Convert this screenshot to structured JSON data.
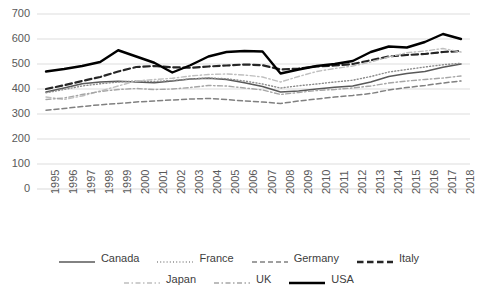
{
  "chart_data": {
    "type": "line",
    "title": "",
    "xlabel": "",
    "ylabel": "",
    "grid": true,
    "legend_position": "bottom",
    "ylim": [
      0,
      700
    ],
    "yticks": [
      0,
      100,
      200,
      300,
      400,
      500,
      600,
      700
    ],
    "categories": [
      "1995",
      "1996",
      "1997",
      "1998",
      "1999",
      "2000",
      "2001",
      "2002",
      "2003",
      "2004",
      "2005",
      "2006",
      "2007",
      "2008",
      "2009",
      "2010",
      "2011",
      "2012",
      "2013",
      "2014",
      "2015",
      "2016",
      "2017",
      "2018"
    ],
    "series": [
      {
        "name": "Canada",
        "style": "solid",
        "color": "#595959",
        "width": 1.6,
        "values": [
          388,
          404,
          421,
          428,
          431,
          428,
          425,
          432,
          440,
          443,
          438,
          425,
          410,
          388,
          392,
          400,
          407,
          412,
          428,
          450,
          462,
          470,
          487,
          500
        ]
      },
      {
        "name": "France",
        "style": "dotted",
        "color": "#8c8c8c",
        "width": 1.4,
        "values": [
          385,
          398,
          412,
          421,
          428,
          432,
          430,
          434,
          440,
          444,
          441,
          432,
          420,
          404,
          413,
          420,
          428,
          435,
          450,
          468,
          478,
          488,
          497,
          503
        ]
      },
      {
        "name": "Germany",
        "style": "dashed",
        "color": "#808080",
        "width": 1.5,
        "values": [
          315,
          322,
          330,
          337,
          342,
          348,
          352,
          356,
          360,
          362,
          358,
          352,
          348,
          342,
          352,
          360,
          368,
          374,
          382,
          396,
          406,
          414,
          424,
          432
        ]
      },
      {
        "name": "Italy",
        "style": "bold-dash",
        "color": "#262626",
        "width": 2.2,
        "values": [
          400,
          415,
          432,
          448,
          470,
          488,
          492,
          487,
          485,
          490,
          494,
          498,
          495,
          478,
          482,
          490,
          494,
          500,
          515,
          530,
          536,
          540,
          548,
          552
        ]
      },
      {
        "name": "Japan",
        "style": "light-dashdot",
        "color": "#bfbfbf",
        "width": 1.4,
        "values": [
          368,
          358,
          372,
          392,
          412,
          432,
          438,
          443,
          452,
          458,
          460,
          456,
          448,
          428,
          450,
          470,
          482,
          492,
          508,
          528,
          545,
          552,
          562,
          548
        ]
      },
      {
        "name": "UK",
        "style": "dashdot",
        "color": "#a6a6a6",
        "width": 1.4,
        "values": [
          358,
          364,
          378,
          390,
          398,
          402,
          398,
          400,
          406,
          414,
          412,
          404,
          396,
          378,
          386,
          394,
          398,
          404,
          412,
          424,
          432,
          438,
          444,
          452
        ]
      },
      {
        "name": "USA",
        "style": "solid-bold",
        "color": "#000000",
        "width": 2.4,
        "values": [
          470,
          480,
          492,
          508,
          555,
          530,
          505,
          466,
          495,
          530,
          548,
          552,
          550,
          462,
          478,
          492,
          500,
          512,
          548,
          570,
          566,
          588,
          620,
          600
        ]
      }
    ]
  },
  "axes": {
    "y_tick_labels": [
      "700",
      "600",
      "500",
      "400",
      "300",
      "200",
      "100",
      "0"
    ],
    "x_tick_labels": [
      "1995",
      "1996",
      "1997",
      "1998",
      "1999",
      "2000",
      "2001",
      "2002",
      "2003",
      "2004",
      "2005",
      "2006",
      "2007",
      "2008",
      "2009",
      "2010",
      "2011",
      "2012",
      "2013",
      "2014",
      "2015",
      "2016",
      "2017",
      "2018"
    ]
  },
  "legend": {
    "row1": [
      {
        "name": "Canada",
        "style": "solid",
        "color": "#595959"
      },
      {
        "name": "France",
        "style": "dotted",
        "color": "#8c8c8c"
      },
      {
        "name": "Germany",
        "style": "dashed",
        "color": "#808080"
      },
      {
        "name": "Italy",
        "style": "bold-dash",
        "color": "#262626"
      }
    ],
    "row2": [
      {
        "name": "Japan",
        "style": "light-dashdot",
        "color": "#bfbfbf"
      },
      {
        "name": "UK",
        "style": "dashdot",
        "color": "#a6a6a6"
      },
      {
        "name": "USA",
        "style": "solid-bold",
        "color": "#000000"
      }
    ]
  },
  "colors": {
    "grid": "#d9d9d9",
    "axis_text": "#595959",
    "background": "#ffffff"
  }
}
